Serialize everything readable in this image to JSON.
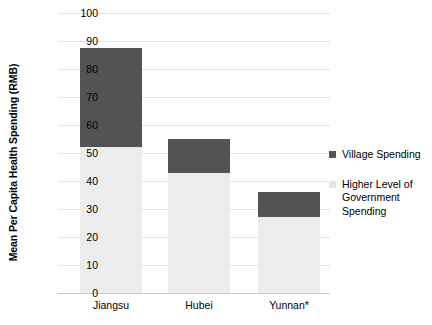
{
  "chart_data": {
    "type": "bar",
    "stacked": true,
    "title": "",
    "subtitle": "",
    "xlabel": "",
    "ylabel": "Mean Per Capita Health Spending (RMB)",
    "categories": [
      "Jiangsu",
      "Hubei",
      "Yunnan*"
    ],
    "series": [
      {
        "name": "Higher Level of Government Spending",
        "color": "#ececec",
        "values": [
          52,
          43,
          27
        ]
      },
      {
        "name": "Village Spending",
        "color": "#535353",
        "values": [
          35.5,
          12,
          9
        ]
      }
    ],
    "totals": [
      87.5,
      55,
      36
    ],
    "ylim": [
      0,
      100
    ],
    "ytick_step": 10,
    "yticks": [
      "100",
      "90",
      "80",
      "70",
      "60",
      "50",
      "40",
      "30",
      "20",
      "10",
      "0"
    ],
    "grid": true,
    "legend_position": "right",
    "annotations": [
      "* Yunnan category label carries an asterisk footnote marker"
    ]
  },
  "legend": {
    "items": [
      {
        "label": "Village Spending",
        "swatch": "village"
      },
      {
        "label": "Higher Level of\nGovernment\nSpending",
        "swatch": "higher"
      }
    ]
  },
  "colors": {
    "village": "#535353",
    "higher_level": "#ececec",
    "gridline": "#e3e3e3",
    "axis": "#c9c9c9",
    "text": "#000000",
    "background": "#ffffff"
  }
}
